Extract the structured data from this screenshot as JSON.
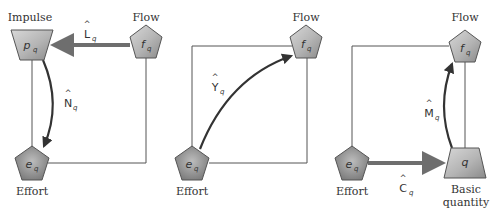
{
  "colors": {
    "node_fill_light": "#c9c9c9",
    "node_fill_dark": "#8a8a8a",
    "node_stroke": "#555555",
    "thin_line": "#555555",
    "thick_arrow": "#6e6e6e",
    "curve_arrow": "#333333",
    "text": "#333333"
  },
  "panels": [
    {
      "id": "panel-1",
      "nodes": {
        "impulse": {
          "symbol": "p",
          "subscript": "q",
          "label": "Impulse",
          "shape": "trapezoid"
        },
        "flow": {
          "symbol": "f",
          "subscript": "q",
          "label": "Flow",
          "shape": "pentagon"
        },
        "effort": {
          "symbol": "e",
          "subscript": "q",
          "label": "Effort",
          "shape": "pentagon"
        }
      },
      "operators": {
        "L": {
          "hat": "^",
          "letter": "L",
          "subscript": "q"
        },
        "N": {
          "hat": "^",
          "letter": "N",
          "subscript": "q"
        }
      }
    },
    {
      "id": "panel-2",
      "nodes": {
        "flow": {
          "symbol": "f",
          "subscript": "q",
          "label": "Flow",
          "shape": "pentagon"
        },
        "effort": {
          "symbol": "e",
          "subscript": "q",
          "label": "Effort",
          "shape": "pentagon"
        }
      },
      "operators": {
        "Y": {
          "hat": "^",
          "letter": "Y",
          "subscript": "q"
        }
      }
    },
    {
      "id": "panel-3",
      "nodes": {
        "flow": {
          "symbol": "f",
          "subscript": "q",
          "label": "Flow",
          "shape": "pentagon"
        },
        "effort": {
          "symbol": "e",
          "subscript": "q",
          "label": "Effort",
          "shape": "pentagon"
        },
        "basic": {
          "symbol": "q",
          "subscript": "",
          "label_line1": "Basic",
          "label_line2": "quantity",
          "shape": "trapezoid"
        }
      },
      "operators": {
        "M": {
          "hat": "^",
          "letter": "M",
          "subscript": "q"
        },
        "C": {
          "hat": "^",
          "letter": "C",
          "subscript": "q"
        }
      }
    }
  ]
}
